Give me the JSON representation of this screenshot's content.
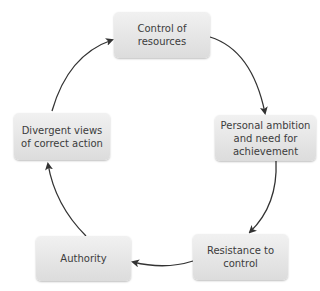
{
  "diagram": {
    "type": "cycle",
    "nodes": [
      {
        "id": "control",
        "label": "Control of resources"
      },
      {
        "id": "ambition",
        "label": "Personal ambition and need for achievement"
      },
      {
        "id": "resistance",
        "label": "Resistance to control"
      },
      {
        "id": "authority",
        "label": "Authority"
      },
      {
        "id": "divergent",
        "label": "Divergent views of correct action"
      }
    ],
    "edges": [
      {
        "from": "control",
        "to": "ambition"
      },
      {
        "from": "ambition",
        "to": "resistance"
      },
      {
        "from": "resistance",
        "to": "authority"
      },
      {
        "from": "authority",
        "to": "divergent"
      },
      {
        "from": "divergent",
        "to": "control"
      }
    ],
    "direction": "clockwise"
  }
}
